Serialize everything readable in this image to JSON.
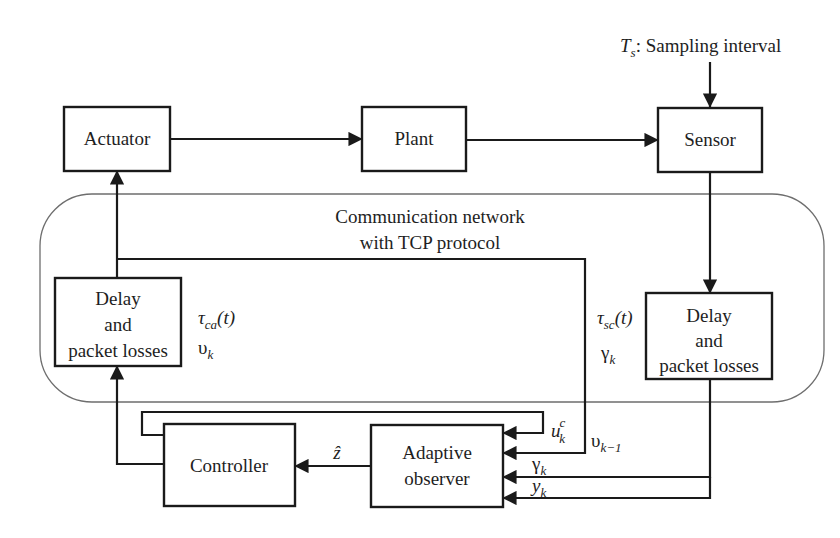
{
  "diagram": {
    "type": "block-diagram",
    "sampling": {
      "symbol": "T",
      "symbol_sub": "s",
      "label": ": Sampling interval"
    },
    "network": {
      "title_line1": "Communication network",
      "title_line2": "with TCP protocol"
    },
    "blocks": {
      "actuator": "Actuator",
      "plant": "Plant",
      "sensor": "Sensor",
      "delay_left": [
        "Delay",
        "and",
        "packet losses"
      ],
      "delay_right": [
        "Delay",
        "and",
        "packet losses"
      ],
      "controller": "Controller",
      "observer": [
        "Adaptive",
        "observer"
      ]
    },
    "signals": {
      "tau_ca": {
        "sym": "τ",
        "sub": "ca",
        "arg": "(t)"
      },
      "upsilon_k": {
        "sym": "υ",
        "sub": "k"
      },
      "tau_sc": {
        "sym": "τ",
        "sub": "sc",
        "arg": "(t)"
      },
      "gamma_k_right": {
        "sym": "γ",
        "sub": "k"
      },
      "z_hat": {
        "sym": "ẑ"
      },
      "u_k_c": {
        "sym": "u",
        "sub": "k",
        "sup": "c"
      },
      "upsilon_km1": {
        "sym": "υ",
        "sub": "k−1"
      },
      "gamma_k_obs": {
        "sym": "γ",
        "sub": "k"
      },
      "y_k_obs": {
        "sym": "y",
        "sub": "k"
      }
    },
    "colors": {
      "line": "#1a1a1a",
      "network_border": "#6e6e6e",
      "background": "#ffffff"
    }
  }
}
